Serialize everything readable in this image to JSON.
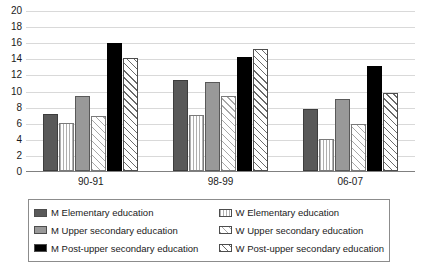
{
  "chart_data": {
    "type": "bar",
    "title": "",
    "xlabel": "",
    "ylabel": "",
    "categories": [
      "90-91",
      "98-99",
      "06-07"
    ],
    "ylim": [
      0,
      20
    ],
    "yticks": [
      0,
      2,
      4,
      6,
      8,
      10,
      12,
      14,
      16,
      18,
      20
    ],
    "grid": true,
    "legend_position": "bottom",
    "series": [
      {
        "name": "M Elementary education",
        "fill": "darkgray",
        "values": [
          7.1,
          11.3,
          7.7
        ]
      },
      {
        "name": "W Elementary education",
        "fill": "vlines",
        "values": [
          6.0,
          7.0,
          4.0
        ]
      },
      {
        "name": "M Upper secondary education",
        "fill": "midgray",
        "values": [
          9.3,
          11.0,
          8.9
        ]
      },
      {
        "name": "W Upper secondary education",
        "fill": "hatch-light",
        "values": [
          6.8,
          9.3,
          5.9
        ]
      },
      {
        "name": "M Post-upper secondary education",
        "fill": "black",
        "values": [
          15.9,
          14.2,
          13.1
        ]
      },
      {
        "name": "W Post-upper secondary education",
        "fill": "hatch-dark",
        "values": [
          14.0,
          15.2,
          9.7
        ]
      }
    ]
  },
  "legend": {
    "left_column": [
      {
        "label": "M Elementary education",
        "fill": "darkgray"
      },
      {
        "label": "M Upper secondary education",
        "fill": "midgray"
      },
      {
        "label": "M Post-upper secondary education",
        "fill": "black"
      }
    ],
    "right_column": [
      {
        "label": "W Elementary education",
        "fill": "vlines"
      },
      {
        "label": "W Upper secondary education",
        "fill": "hatch-light"
      },
      {
        "label": "W Post-upper secondary education",
        "fill": "hatch-dark"
      }
    ]
  },
  "colors": {
    "dark_gray": "#595959",
    "mid_gray": "#999999",
    "black": "#000000",
    "gridline": "#d9d9d9",
    "axis": "#808080"
  }
}
